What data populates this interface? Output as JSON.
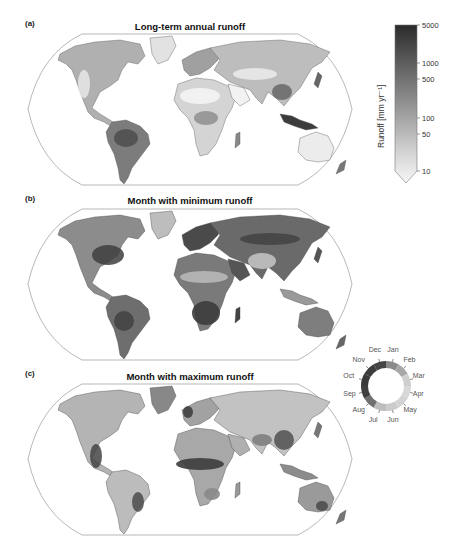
{
  "panels": [
    {
      "label": "(a)",
      "title": "Long-term annual runoff"
    },
    {
      "label": "(b)",
      "title": "Month with minimum runoff"
    },
    {
      "label": "(c)",
      "title": "Month with maximum runoff"
    }
  ],
  "colorbar": {
    "label": "Runoff [mm yr⁻¹]",
    "ticks": [
      "5000",
      "1000",
      "500",
      "100",
      "50",
      "10"
    ],
    "scale": "log",
    "extend": "min",
    "colors": {
      "top": "#2b2b2b",
      "bottom": "#f7f7f7"
    }
  },
  "month_wheel": {
    "months": [
      "Jan",
      "Feb",
      "Mar",
      "Apr",
      "May",
      "Jun",
      "Jul",
      "Aug",
      "Sep",
      "Oct",
      "Nov",
      "Dec"
    ],
    "colors": [
      "#8a8a8a",
      "#a7a7a7",
      "#cfcfcf",
      "#d8d8d8",
      "#d3d3d3",
      "#cbcbcb",
      "#bdbdbd",
      "#6f6f6f",
      "#404040",
      "#3a3a3a",
      "#3c3c3c",
      "#444444"
    ]
  },
  "chart_data": [
    {
      "type": "heatmap",
      "title": "Long-term annual runoff",
      "panel": "(a)",
      "projection": "Robinson (global)",
      "colorbar": {
        "label": "Runoff [mm yr-1]",
        "scale": "log",
        "ticks": [
          10,
          50,
          100,
          500,
          1000,
          5000
        ],
        "range": [
          10,
          5000
        ],
        "extend": "min"
      },
      "notes": "Highest runoff (dark) in Amazon, Congo, SE Asia/Indonesia, Pacific NW coasts; lowest (white) in Sahara, Arabia, Australia interior, central Asia."
    },
    {
      "type": "heatmap",
      "title": "Month with minimum runoff",
      "panel": "(b)",
      "projection": "Robinson (global)",
      "colorbar": {
        "type": "cyclic",
        "categories": [
          "Jan",
          "Feb",
          "Mar",
          "Apr",
          "May",
          "Jun",
          "Jul",
          "Aug",
          "Sep",
          "Oct",
          "Nov",
          "Dec"
        ]
      }
    },
    {
      "type": "heatmap",
      "title": "Month with maximum runoff",
      "panel": "(c)",
      "projection": "Robinson (global)",
      "colorbar": {
        "type": "cyclic",
        "categories": [
          "Jan",
          "Feb",
          "Mar",
          "Apr",
          "May",
          "Jun",
          "Jul",
          "Aug",
          "Sep",
          "Oct",
          "Nov",
          "Dec"
        ]
      }
    }
  ]
}
